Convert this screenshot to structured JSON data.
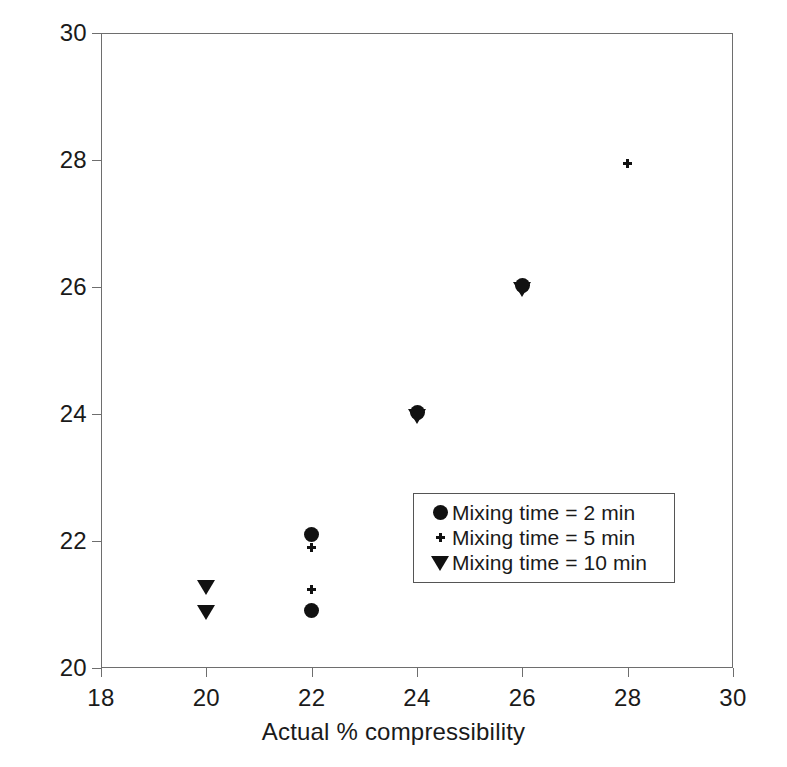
{
  "chart_data": {
    "type": "scatter",
    "title": "",
    "xlabel": "Actual % compressibility",
    "ylabel": "Predicted % compressibility",
    "xlim": [
      18,
      30
    ],
    "ylim": [
      20,
      30
    ],
    "xticks": [
      18,
      20,
      22,
      24,
      26,
      28,
      30
    ],
    "yticks": [
      20,
      22,
      24,
      26,
      28,
      30
    ],
    "grid": false,
    "legend_position": "center-right",
    "series": [
      {
        "name": "Mixing time = 2 min",
        "marker": "filled-circle",
        "color": "#111111",
        "points": [
          {
            "x": 22.0,
            "y": 22.11
          },
          {
            "x": 22.0,
            "y": 20.91
          },
          {
            "x": 24.0,
            "y": 24.03
          },
          {
            "x": 26.0,
            "y": 26.03
          }
        ]
      },
      {
        "name": "Mixing time = 5 min",
        "marker": "plus",
        "color": "#111111",
        "points": [
          {
            "x": 22.0,
            "y": 21.9
          },
          {
            "x": 22.0,
            "y": 21.24
          },
          {
            "x": 24.0,
            "y": 24.01
          },
          {
            "x": 26.0,
            "y": 26.01
          },
          {
            "x": 28.0,
            "y": 27.95
          }
        ]
      },
      {
        "name": "Mixing time = 10 min",
        "marker": "filled-triangle-down",
        "color": "#111111",
        "points": [
          {
            "x": 20.0,
            "y": 21.28
          },
          {
            "x": 20.0,
            "y": 20.88
          },
          {
            "x": 24.0,
            "y": 23.97
          },
          {
            "x": 26.0,
            "y": 25.97
          }
        ]
      }
    ]
  },
  "axes": {
    "xtick_labels": [
      "18",
      "20",
      "22",
      "24",
      "26",
      "28",
      "30"
    ],
    "ytick_labels": [
      "20",
      "22",
      "24",
      "26",
      "28",
      "30"
    ],
    "xlabel": "Actual % compressibility",
    "ylabel": "Predicted % compressibility"
  },
  "legend": {
    "entries": [
      {
        "label": "Mixing time = 2 min",
        "marker": "filled-circle"
      },
      {
        "label": "Mixing time = 5 min",
        "marker": "plus"
      },
      {
        "label": "Mixing time = 10 min",
        "marker": "filled-triangle-down"
      }
    ]
  },
  "colors": {
    "marker": "#111111",
    "axis": "#6e6e6e",
    "legend_border": "#555555",
    "background": "#ffffff"
  }
}
